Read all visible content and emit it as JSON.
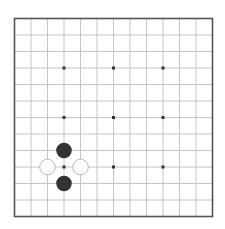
{
  "board": {
    "size": 13,
    "origin_x": 14.5,
    "origin_y": 18.5,
    "spacing": 16.5,
    "line_color": "#c4c4c4",
    "border_color": "#555555",
    "background": "#ffffff",
    "star_color": "#333333",
    "star_points": [
      [
        3,
        3
      ],
      [
        6,
        3
      ],
      [
        9,
        3
      ],
      [
        3,
        6
      ],
      [
        6,
        6
      ],
      [
        9,
        6
      ],
      [
        3,
        9
      ],
      [
        6,
        9
      ],
      [
        9,
        9
      ]
    ]
  },
  "stones": [
    {
      "color": "black",
      "col": 3,
      "row": 8
    },
    {
      "color": "black",
      "col": 3,
      "row": 10
    },
    {
      "color": "white",
      "col": 2,
      "row": 9
    },
    {
      "color": "white",
      "col": 4,
      "row": 9
    }
  ],
  "colors": {
    "black_stone": "#333333",
    "white_stone": "#ffffff",
    "white_stone_edge": "#bbbbbb"
  }
}
